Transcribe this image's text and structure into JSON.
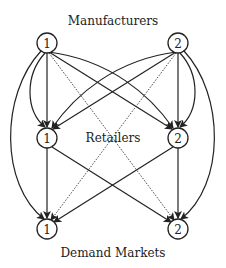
{
  "diagram": {
    "title_top": "Manufacturers",
    "title_middle": "Retailers",
    "title_bottom": "Demand Markets",
    "tiers": [
      {
        "name": "Manufacturers",
        "nodes": [
          {
            "id": "M1",
            "label": "1"
          },
          {
            "id": "M2",
            "label": "2"
          }
        ]
      },
      {
        "name": "Retailers",
        "nodes": [
          {
            "id": "R1",
            "label": "1"
          },
          {
            "id": "R2",
            "label": "2"
          }
        ]
      },
      {
        "name": "Demand Markets",
        "nodes": [
          {
            "id": "D1",
            "label": "1"
          },
          {
            "id": "D2",
            "label": "2"
          }
        ]
      }
    ],
    "edges": [
      {
        "from": "M1",
        "to": "R1",
        "style": "solid",
        "count": 2
      },
      {
        "from": "M1",
        "to": "R2",
        "style": "solid",
        "count": 2
      },
      {
        "from": "M2",
        "to": "R1",
        "style": "solid",
        "count": 2
      },
      {
        "from": "M2",
        "to": "R2",
        "style": "solid",
        "count": 2
      },
      {
        "from": "M1",
        "to": "D2",
        "style": "dotted"
      },
      {
        "from": "M2",
        "to": "D1",
        "style": "dotted"
      },
      {
        "from": "M1",
        "to": "D1",
        "style": "solid-arc"
      },
      {
        "from": "M2",
        "to": "D2",
        "style": "solid-arc"
      },
      {
        "from": "R1",
        "to": "D1",
        "style": "solid"
      },
      {
        "from": "R1",
        "to": "D2",
        "style": "solid"
      },
      {
        "from": "R2",
        "to": "D1",
        "style": "solid"
      },
      {
        "from": "R2",
        "to": "D2",
        "style": "solid"
      }
    ],
    "colors": {
      "stroke": "#222222",
      "background": "#ffffff"
    }
  }
}
